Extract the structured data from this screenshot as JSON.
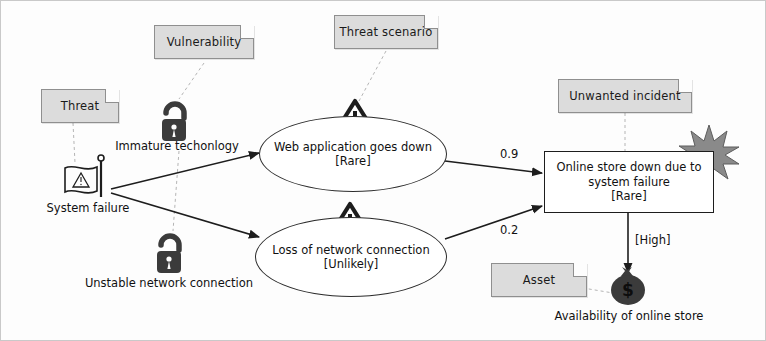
{
  "diagram": {
    "colors": {
      "note_fill": "#dcdcdc",
      "note_border": "#8f8f8f",
      "stroke": "#1d1d1d",
      "icon_dark": "#3b3b3b",
      "starburst": "#8a8a8a",
      "canvas": "#fdfdfd"
    }
  },
  "notes": [
    {
      "id": "threat",
      "label": "Threat"
    },
    {
      "id": "vulnerability",
      "label": "Vulnerability"
    },
    {
      "id": "threat_scenario",
      "label": "Threat scenario"
    },
    {
      "id": "unwanted_incident",
      "label": "Unwanted incident"
    },
    {
      "id": "asset",
      "label": "Asset"
    }
  ],
  "threats": [
    {
      "id": "system-failure",
      "label": "System failure",
      "icon": "flag-warning-icon"
    }
  ],
  "vulnerabilities": [
    {
      "id": "immature-technology",
      "label": "Immature techonlogy",
      "icon": "open-padlock-icon"
    },
    {
      "id": "unstable-network",
      "label": "Unstable network connection",
      "icon": "open-padlock-icon"
    }
  ],
  "threat_scenarios": [
    {
      "id": "web-app-down",
      "name": "Web application goes down",
      "likelihood": "[Rare]",
      "icon": "warning-triangle-icon"
    },
    {
      "id": "loss-of-network",
      "name": "Loss of network connection",
      "likelihood": "[Unlikely]",
      "icon": "warning-triangle-icon"
    }
  ],
  "unwanted_incident": {
    "id": "online-store-down",
    "name_line1": "Online store down due to",
    "name_line2": "system failure",
    "likelihood": "[Rare]",
    "icon": "starburst-icon"
  },
  "asset": {
    "id": "availability-online-store",
    "label": "Availability of online store",
    "icon": "money-bag-icon"
  },
  "edges": [
    {
      "id": "web-app-to-incident",
      "label": "0.9"
    },
    {
      "id": "network-to-incident",
      "label": "0.2"
    },
    {
      "id": "incident-to-asset",
      "label": "[High]"
    }
  ]
}
